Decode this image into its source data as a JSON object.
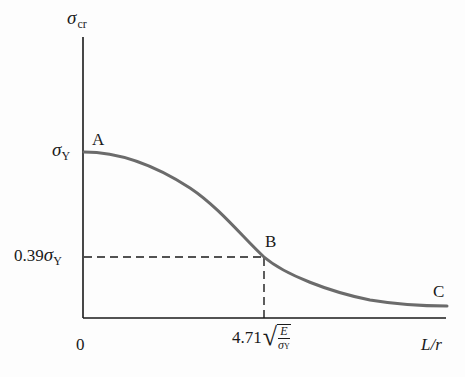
{
  "diagram": {
    "type": "column-critical-stress-curve",
    "y_axis_label": {
      "symbol": "σ",
      "subscript": "cr"
    },
    "x_axis_label": "L/r",
    "origin_label": "0",
    "y_ticks": [
      {
        "symbol": "σ",
        "subscript": "Y",
        "prefix": ""
      },
      {
        "symbol": "σ",
        "subscript": "Y",
        "prefix": "0.39"
      }
    ],
    "x_tick": {
      "coefficient": "4.71",
      "fraction_numerator": "E",
      "fraction_denominator_symbol": "σ",
      "fraction_denominator_subscript": "Y"
    },
    "points": [
      {
        "label": "A",
        "description": "curve start at σY"
      },
      {
        "label": "B",
        "description": "transition point at 0.39σY"
      },
      {
        "label": "C",
        "description": "curve end"
      }
    ],
    "colors": {
      "curve": "#6b6b6b",
      "axes": "#1a1a1a",
      "dashed": "#1a1a1a",
      "background": "#fdfdfd"
    }
  }
}
